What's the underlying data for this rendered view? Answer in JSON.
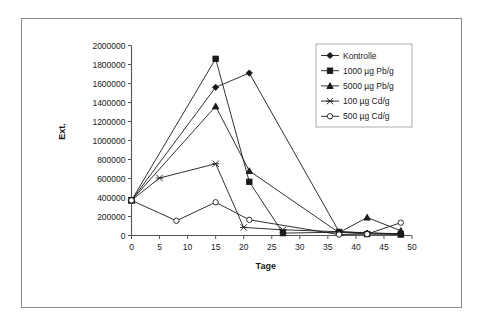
{
  "chart_data": {
    "type": "line",
    "title": "",
    "xlabel": "Tage",
    "ylabel": "Ext.",
    "xlim": [
      0,
      50
    ],
    "ylim": [
      0,
      2000000
    ],
    "xticks": [
      0,
      5,
      10,
      15,
      20,
      25,
      30,
      35,
      40,
      45,
      50
    ],
    "yticks": [
      0,
      200000,
      400000,
      600000,
      800000,
      1000000,
      1200000,
      1400000,
      1600000,
      1800000,
      2000000
    ],
    "xtick_labels": [
      "0",
      "5",
      "10",
      "15",
      "20",
      "25",
      "30",
      "35",
      "40",
      "45",
      "50"
    ],
    "ytick_labels": [
      "0",
      "200000",
      "400000",
      "600000",
      "800000",
      "1000000",
      "1200000",
      "1400000",
      "1600000",
      "1800000",
      "2000000"
    ],
    "grid": false,
    "legend_position": "top-right",
    "series": [
      {
        "name": "Kontrolle",
        "marker": "diamond",
        "x": [
          0,
          15,
          21,
          37,
          42,
          48
        ],
        "values": [
          370000,
          1560000,
          1710000,
          40000,
          25000,
          20000
        ]
      },
      {
        "name": "1000 µg Pb/g",
        "marker": "square",
        "x": [
          0,
          15,
          21,
          27,
          37,
          42,
          48
        ],
        "values": [
          370000,
          1860000,
          565000,
          25000,
          35000,
          15000,
          10000
        ]
      },
      {
        "name": "5000 µg Pb/g",
        "marker": "triangle",
        "x": [
          0,
          15,
          21,
          37,
          42,
          48
        ],
        "values": [
          370000,
          1360000,
          680000,
          30000,
          190000,
          50000
        ]
      },
      {
        "name": "100 µg Cd/g",
        "marker": "star",
        "x": [
          0,
          5,
          15,
          20,
          27,
          37,
          48
        ],
        "values": [
          370000,
          605000,
          755000,
          85000,
          60000,
          40000,
          15000
        ]
      },
      {
        "name": "500 µg Cd/g",
        "marker": "circle",
        "x": [
          0,
          8,
          15,
          21,
          37,
          42,
          48
        ],
        "values": [
          370000,
          155000,
          350000,
          165000,
          10000,
          15000,
          135000
        ]
      }
    ]
  },
  "legend": {
    "entries": [
      {
        "label": "Kontrolle",
        "marker": "diamond"
      },
      {
        "label": "1000 µg Pb/g",
        "marker": "square"
      },
      {
        "label": "5000 µg Pb/g",
        "marker": "triangle"
      },
      {
        "label": "100 µg Cd/g",
        "marker": "star"
      },
      {
        "label": "500 µg Cd/g",
        "marker": "circle"
      }
    ]
  },
  "colors": {
    "line": "#1a1a1a",
    "axis": "#555555",
    "frame": "#8a8a8a",
    "background": "#ffffff"
  }
}
